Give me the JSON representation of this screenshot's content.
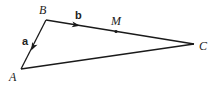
{
  "diagram": {
    "type": "triangle-vectors",
    "points": {
      "A": {
        "label": "A",
        "x": 21,
        "y": 69,
        "lx": 9,
        "ly": 81
      },
      "B": {
        "label": "B",
        "x": 46,
        "y": 20,
        "lx": 39,
        "ly": 14
      },
      "C": {
        "label": "C",
        "x": 194,
        "y": 44,
        "lx": 199,
        "ly": 50
      },
      "M": {
        "label": "M",
        "x": 116,
        "y": 32,
        "lx": 111,
        "ly": 25
      }
    },
    "vectors": [
      {
        "label": "a",
        "from": "B",
        "to": "A",
        "arrow_x": 33,
        "arrow_y": 47,
        "lx": 22,
        "ly": 45
      },
      {
        "label": "b",
        "from": "B",
        "to": "C",
        "arrow_x": 76,
        "arrow_y": 25,
        "lx": 75,
        "ly": 19
      }
    ],
    "note": "M is the midpoint of BC",
    "stroke_color": "#1a1a1a"
  }
}
